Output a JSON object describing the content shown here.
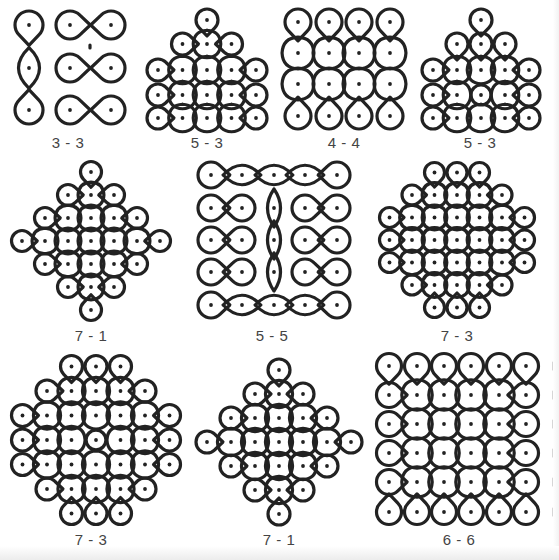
{
  "figure": {
    "stroke_color": "#222222",
    "dot_color": "#222222",
    "background": "#ffffff"
  },
  "panels": [
    {
      "id": "p1",
      "label": "3 - 3",
      "label_pos": [
        68,
        134
      ],
      "kind": "3-3"
    },
    {
      "id": "p2",
      "label": "5 - 3",
      "label_pos": [
        207,
        134
      ],
      "kind": "5-3a"
    },
    {
      "id": "p3",
      "label": "4 - 4",
      "label_pos": [
        344,
        134
      ],
      "kind": "4-4"
    },
    {
      "id": "p4",
      "label": "5 - 3",
      "label_pos": [
        480,
        134
      ],
      "kind": "5-3b"
    },
    {
      "id": "p5",
      "label": "7 - 1",
      "label_pos": [
        91,
        327
      ],
      "kind": "7-1a"
    },
    {
      "id": "p6",
      "label": "5 - 5",
      "label_pos": [
        272,
        327
      ],
      "kind": "5-5"
    },
    {
      "id": "p7",
      "label": "7 - 3",
      "label_pos": [
        457,
        327
      ],
      "kind": "7-3a"
    },
    {
      "id": "p8",
      "label": "7 - 3",
      "label_pos": [
        91,
        531
      ],
      "kind": "7-3b"
    },
    {
      "id": "p9",
      "label": "7 - 1",
      "label_pos": [
        279,
        531
      ],
      "kind": "7-1b"
    },
    {
      "id": "p10",
      "label": "6 - 6",
      "label_pos": [
        459,
        531
      ],
      "kind": "6-6"
    }
  ]
}
